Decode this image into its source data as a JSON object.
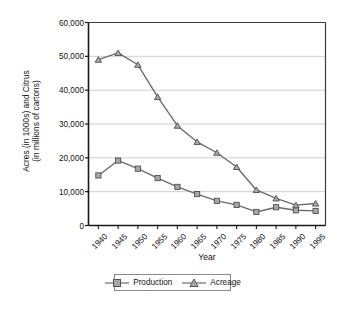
{
  "chart_data": {
    "type": "line",
    "title": "",
    "xlabel": "Year",
    "ylabel": "Acres (in 1000s) and Citrus (in millions of cartons)",
    "ylabel_line1": "Acres (in 1000s) and Citrus",
    "ylabel_line2": "(in millions of cartons)",
    "categories": [
      "1940",
      "1945",
      "1950",
      "1955",
      "1960",
      "1965",
      "1970",
      "1975",
      "1980",
      "1985",
      "1990",
      "1995"
    ],
    "x": [
      1940,
      1945,
      1950,
      1955,
      1960,
      1965,
      1970,
      1975,
      1980,
      1985,
      1990,
      1995
    ],
    "ylim": [
      0,
      60000
    ],
    "ytick_labels": [
      "0",
      "10,000",
      "20,000",
      "30,000",
      "40,000",
      "50,000",
      "60,000"
    ],
    "ytick_values": [
      0,
      10000,
      20000,
      30000,
      40000,
      50000,
      60000
    ],
    "grid": true,
    "legend_position": "below",
    "series": [
      {
        "name": "Production",
        "marker": "square",
        "color": "#6b6b6b",
        "values": [
          14800,
          19200,
          16800,
          14000,
          11400,
          9300,
          7300,
          6100,
          4000,
          5400,
          4500,
          4300
        ]
      },
      {
        "name": "Acreage",
        "marker": "triangle",
        "color": "#6b6b6b",
        "values": [
          49000,
          51000,
          47500,
          38000,
          29500,
          24700,
          21500,
          17300,
          10500,
          8000,
          6000,
          6500
        ]
      }
    ]
  },
  "legend": {
    "items": [
      {
        "label": "Production",
        "marker": "square-marker-icon"
      },
      {
        "label": "Acreage",
        "marker": "triangle-marker-icon"
      }
    ]
  },
  "axis": {
    "x_title": "Year",
    "y_title_line1": "Acres (in 1000s) and Citrus",
    "y_title_line2": "(in millions of cartons)"
  }
}
